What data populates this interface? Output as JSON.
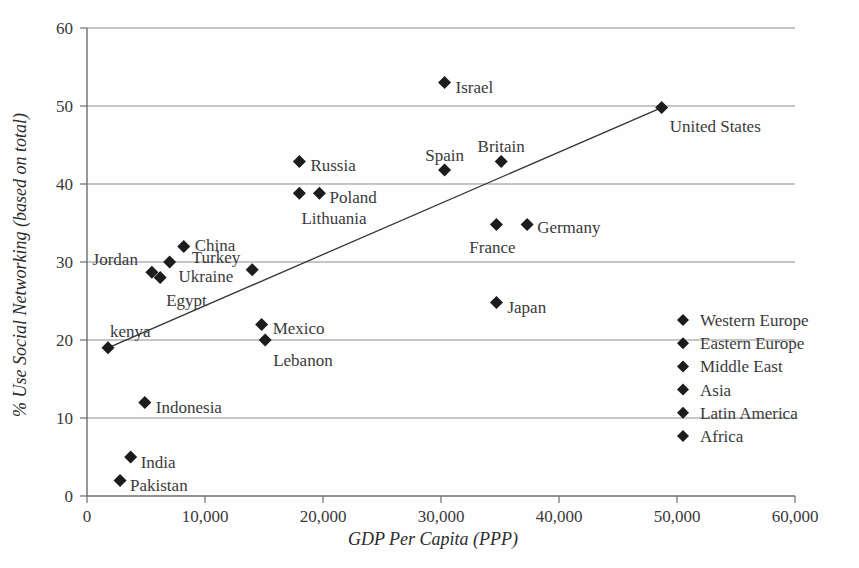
{
  "chart_data": {
    "type": "scatter",
    "title": "",
    "xlabel": "GDP Per Capita (PPP)",
    "ylabel": "% Use Social Networking (based on total)",
    "xlim": [
      0,
      60000
    ],
    "ylim": [
      0,
      60
    ],
    "xticks": [
      "0",
      "10,000",
      "20,000",
      "30,000",
      "40,000",
      "50,000",
      "60,000"
    ],
    "xtick_values": [
      0,
      10000,
      20000,
      30000,
      40000,
      50000,
      60000
    ],
    "yticks": [
      "0",
      "10",
      "20",
      "30",
      "40",
      "50",
      "60"
    ],
    "ytick_values": [
      0,
      10,
      20,
      30,
      40,
      50,
      60
    ],
    "grid": "horizontal",
    "legend_position": "right-inside",
    "points": [
      {
        "label": "Pakistan",
        "x": 2800,
        "y": 2.0,
        "label_dx": 10,
        "label_dy": 6,
        "anchor": "start"
      },
      {
        "label": "India",
        "x": 3700,
        "y": 5.0,
        "label_dx": 10,
        "label_dy": 6,
        "anchor": "start"
      },
      {
        "label": "Indonesia",
        "x": 4900,
        "y": 12.0,
        "label_dx": 11,
        "label_dy": 6,
        "anchor": "start"
      },
      {
        "label": "kenya",
        "x": 1780,
        "y": 19.0,
        "label_dx": 2,
        "label_dy": -16,
        "anchor": "start"
      },
      {
        "label": "Jordan",
        "x": 5500,
        "y": 28.7,
        "label_dx": -14,
        "label_dy": -12,
        "anchor": "end"
      },
      {
        "label": "Egypt",
        "x": 6200,
        "y": 28.0,
        "label_dx": 6,
        "label_dy": 23,
        "anchor": "start"
      },
      {
        "label": "Ukraine",
        "x": 7000,
        "y": 30.0,
        "label_dx": 9,
        "label_dy": 15,
        "anchor": "start"
      },
      {
        "label": "China",
        "x": 8200,
        "y": 32.0,
        "label_dx": 11,
        "label_dy": 0,
        "anchor": "start"
      },
      {
        "label": "Mexico",
        "x": 14800,
        "y": 22.0,
        "label_dx": 11,
        "label_dy": 5,
        "anchor": "start"
      },
      {
        "label": "Lebanon",
        "x": 15100,
        "y": 20.0,
        "label_dx": 8,
        "label_dy": 21,
        "anchor": "start"
      },
      {
        "label": "Turkey",
        "x": 14000,
        "y": 29.0,
        "label_dx": -12,
        "label_dy": -12,
        "anchor": "end"
      },
      {
        "label": "Lithuania",
        "x": 18000,
        "y": 38.8,
        "label_dx": 2,
        "label_dy": 26,
        "anchor": "start"
      },
      {
        "label": "Poland",
        "x": 19700,
        "y": 38.8,
        "label_dx": 10,
        "label_dy": 5,
        "anchor": "start"
      },
      {
        "label": "Russia",
        "x": 18000,
        "y": 42.9,
        "label_dx": 11,
        "label_dy": 5,
        "anchor": "start"
      },
      {
        "label": "Israel",
        "x": 30300,
        "y": 53.0,
        "label_dx": 11,
        "label_dy": 5,
        "anchor": "start"
      },
      {
        "label": "Spain",
        "x": 30300,
        "y": 41.8,
        "label_dx": 0,
        "label_dy": -14,
        "anchor": "middle"
      },
      {
        "label": "Britain",
        "x": 35100,
        "y": 42.9,
        "label_dx": 0,
        "label_dy": -14,
        "anchor": "middle"
      },
      {
        "label": "France",
        "x": 34700,
        "y": 34.8,
        "label_dx": -4,
        "label_dy": 23,
        "anchor": "middle"
      },
      {
        "label": "Germany",
        "x": 37300,
        "y": 34.8,
        "label_dx": 10,
        "label_dy": 3,
        "anchor": "start"
      },
      {
        "label": "Japan",
        "x": 34700,
        "y": 24.8,
        "label_dx": 11,
        "label_dy": 5,
        "anchor": "start"
      },
      {
        "label": "United States",
        "x": 48700,
        "y": 49.8,
        "label_dx": 8,
        "label_dy": 19,
        "anchor": "start"
      }
    ],
    "trendline": {
      "x1": 1780,
      "y1": 19.0,
      "x2": 48700,
      "y2": 49.8
    }
  },
  "legend": {
    "items": [
      {
        "label": "Western Europe"
      },
      {
        "label": "Eastern Europe"
      },
      {
        "label": "Middle East"
      },
      {
        "label": "Asia"
      },
      {
        "label": "Latin America"
      },
      {
        "label": "Africa"
      }
    ]
  },
  "colors": {
    "marker": "#1c1c1c",
    "grid": "#8d8d8d",
    "axis": "#6d6d6d",
    "trend": "#333333",
    "text": "#3a3a3a",
    "background": "#fefefe"
  }
}
